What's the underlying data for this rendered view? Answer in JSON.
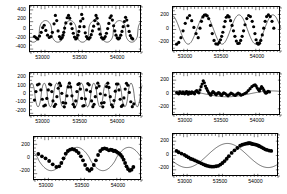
{
  "figure": {
    "width": 287,
    "height": 194,
    "background": "#ffffff",
    "ink": "#000000",
    "layout": "2 columns x 3 rows of time-series panels"
  },
  "chart_data": [
    {
      "type": "scatter",
      "id": "panel-1",
      "position": "top-left",
      "title": "",
      "xlabel": "",
      "ylabel": "",
      "xlim": [
        52820,
        54320
      ],
      "ylim": [
        -500,
        500
      ],
      "xticks": [
        53000,
        53500,
        54000
      ],
      "xticklabels": [
        "53000",
        "53500",
        "54000"
      ],
      "yticks": [
        -400,
        -200,
        0,
        200,
        400
      ],
      "yticklabels": [
        "-400",
        "-200",
        "0",
        "200",
        "400"
      ],
      "grid": false,
      "legend": null,
      "model": {
        "kind": "sine",
        "description": "asymmetric periodic curve with sharp narrow peaks",
        "amplitude": 230,
        "period": 330,
        "phase": 0.62,
        "offset": -40,
        "sharpness": 2.6
      },
      "x": [
        52880,
        52905,
        52925,
        52948,
        52970,
        52990,
        53010,
        53032,
        53055,
        53078,
        53100,
        53120,
        53142,
        53160,
        53178,
        53196,
        53214,
        53232,
        53250,
        53262,
        53272,
        53284,
        53300,
        53318,
        53336,
        53352,
        53368,
        53384,
        53400,
        53416,
        53432,
        53448,
        53462,
        53474,
        53486,
        53498,
        53512,
        53528,
        53544,
        53560,
        53576,
        53592,
        53608,
        53624,
        53640,
        53656,
        53672,
        53688,
        53704,
        53718,
        53730,
        53744,
        53760,
        53778,
        53796,
        53812,
        53828,
        53844,
        53860,
        53876,
        53892,
        53908,
        53924,
        53940,
        53956,
        53972,
        53988,
        54004,
        54020,
        54036,
        54052,
        54068,
        54084,
        54100,
        54116,
        54132,
        54148,
        54164,
        54180,
        54196
      ],
      "y": [
        -150,
        -180,
        -200,
        -140,
        -60,
        40,
        90,
        -20,
        -120,
        -170,
        -150,
        -60,
        120,
        300,
        190,
        -30,
        -150,
        -200,
        -170,
        -120,
        -60,
        30,
        140,
        250,
        300,
        240,
        120,
        20,
        -80,
        -160,
        -200,
        -180,
        -120,
        -40,
        60,
        180,
        320,
        230,
        60,
        -70,
        -150,
        -190,
        -200,
        -170,
        -110,
        -30,
        70,
        190,
        300,
        240,
        120,
        10,
        -100,
        -170,
        -200,
        -190,
        -150,
        -80,
        20,
        130,
        250,
        290,
        200,
        80,
        -30,
        -120,
        -180,
        -200,
        -180,
        -120,
        -40,
        60,
        170,
        260,
        200,
        80,
        -40,
        -130,
        -180,
        -200
      ]
    },
    {
      "type": "scatter",
      "id": "panel-2",
      "position": "top-right",
      "title": "",
      "xlabel": "",
      "ylabel": "",
      "xlim": [
        52820,
        54320
      ],
      "ylim": [
        -330,
        330
      ],
      "xticks": [
        53000,
        53500,
        54000
      ],
      "xticklabels": [
        "53000",
        "53500",
        "54000"
      ],
      "yticks": [
        -200,
        0,
        200
      ],
      "yticklabels": [
        "-200",
        "0",
        "200"
      ],
      "grid": false,
      "legend": null,
      "model": {
        "kind": "sine",
        "description": "smooth sinusoid, about three cycles",
        "amplitude": 215,
        "period": 470,
        "phase": 0.3,
        "offset": 0,
        "sharpness": 1.0
      },
      "x": [
        52870,
        52900,
        52930,
        52960,
        52990,
        53020,
        53050,
        53080,
        53110,
        53140,
        53170,
        53195,
        53215,
        53235,
        53255,
        53275,
        53295,
        53315,
        53340,
        53365,
        53390,
        53415,
        53440,
        53462,
        53480,
        53496,
        53512,
        53528,
        53544,
        53560,
        53580,
        53600,
        53620,
        53640,
        53660,
        53680,
        53700,
        53720,
        53740,
        53760,
        53780,
        53800,
        53820,
        53845,
        53870,
        53895,
        53920,
        53940,
        53958,
        53974,
        53990,
        54006,
        54022,
        54040,
        54060,
        54080,
        54100,
        54120,
        54145,
        54170,
        54195,
        54220
      ],
      "y": [
        -215,
        -190,
        -120,
        -20,
        90,
        170,
        205,
        130,
        30,
        -60,
        -120,
        20,
        120,
        185,
        210,
        215,
        200,
        160,
        60,
        -60,
        -160,
        -210,
        -215,
        -190,
        -150,
        -100,
        -40,
        40,
        120,
        180,
        205,
        185,
        130,
        60,
        -20,
        -100,
        -170,
        -205,
        -200,
        -160,
        -100,
        -20,
        70,
        160,
        205,
        190,
        120,
        40,
        -60,
        -150,
        -200,
        -215,
        -200,
        -160,
        -80,
        20,
        120,
        190,
        215,
        190,
        120,
        20
      ]
    },
    {
      "type": "scatter",
      "id": "panel-3",
      "position": "middle-left",
      "title": "",
      "xlabel": "",
      "ylabel": "",
      "xlim": [
        52820,
        54320
      ],
      "ylim": [
        -260,
        260
      ],
      "xticks": [
        53000,
        53500,
        54000
      ],
      "xticklabels": [
        "53000",
        "53500",
        "54000"
      ],
      "yticks": [
        -200,
        -100,
        0,
        100,
        200
      ],
      "yticklabels": [
        "-200",
        "-100",
        "0",
        "100",
        "200"
      ],
      "grid": false,
      "legend": null,
      "model": {
        "kind": "sine",
        "description": "rapid oscillation, roughly nine cycles",
        "amplitude": 140,
        "period": 166,
        "phase": 0.1,
        "offset": 0,
        "sharpness": 1.35
      },
      "x": [
        52880,
        52900,
        52920,
        52942,
        52965,
        52985,
        53005,
        53025,
        53045,
        53065,
        53082,
        53098,
        53112,
        53128,
        53145,
        53162,
        53180,
        53198,
        53215,
        53230,
        53246,
        53262,
        53280,
        53298,
        53315,
        53332,
        53348,
        53365,
        53382,
        53398,
        53415,
        53432,
        53448,
        53462,
        53478,
        53495,
        53512,
        53528,
        53545,
        53562,
        53578,
        53595,
        53612,
        53628,
        53645,
        53662,
        53678,
        53695,
        53712,
        53728,
        53745,
        53762,
        53778,
        53795,
        53812,
        53828,
        53845,
        53862,
        53878,
        53895,
        53912,
        53928,
        53945,
        53962,
        53978,
        53995,
        54012,
        54028,
        54045,
        54062,
        54078,
        54095,
        54112,
        54130,
        54150,
        54170,
        54190,
        54210
      ],
      "y": [
        -60,
        40,
        120,
        130,
        60,
        -50,
        -130,
        -120,
        -40,
        60,
        130,
        120,
        40,
        -70,
        -135,
        -110,
        -20,
        80,
        140,
        110,
        20,
        -90,
        -140,
        -95,
        -10,
        95,
        140,
        95,
        -10,
        -110,
        -140,
        -70,
        40,
        125,
        135,
        70,
        -40,
        -130,
        -125,
        -45,
        60,
        135,
        120,
        40,
        -70,
        -138,
        -110,
        -20,
        85,
        140,
        105,
        15,
        -95,
        -140,
        -90,
        0,
        100,
        140,
        90,
        -20,
        -115,
        -140,
        -65,
        45,
        130,
        130,
        60,
        -50,
        -135,
        -120,
        -35,
        70,
        138,
        115,
        30,
        -80,
        -138,
        -105
      ]
    },
    {
      "type": "scatter",
      "id": "panel-4",
      "position": "middle-right",
      "title": "",
      "xlabel": "",
      "ylabel": "",
      "xlim": [
        52820,
        54320
      ],
      "ylim": [
        -330,
        330
      ],
      "xticks": [
        53000,
        53500,
        54000
      ],
      "xticklabels": [
        "53000",
        "53500",
        "54000"
      ],
      "yticks": [
        -200,
        0,
        200
      ],
      "yticklabels": [
        "-200",
        "0",
        "200"
      ],
      "grid": false,
      "legend": null,
      "model": {
        "kind": "sine",
        "description": "low amplitude long period trend, nearly flat",
        "amplitude": 45,
        "period": 1250,
        "phase": 0.15,
        "offset": 10,
        "sharpness": 1.0
      },
      "x": [
        52870,
        52885,
        52900,
        52915,
        52930,
        52945,
        52958,
        52970,
        52982,
        52995,
        53008,
        53020,
        53032,
        53045,
        53058,
        53070,
        53082,
        53095,
        53108,
        53120,
        53135,
        53150,
        53165,
        53180,
        53195,
        53210,
        53225,
        53240,
        53255,
        53270,
        53285,
        53300,
        53315,
        53330,
        53345,
        53360,
        53375,
        53390,
        53405,
        53420,
        53435,
        53450,
        53465,
        53480,
        53495,
        53510,
        53525,
        53545,
        53565,
        53585,
        53605,
        53625,
        53645,
        53665,
        53685,
        53705,
        53725,
        53745,
        53765,
        53790,
        53815,
        53840,
        53865,
        53890,
        53915,
        53940,
        53960,
        53975,
        53990,
        54005,
        54020,
        54035,
        54050,
        54065,
        54080,
        54095,
        54110,
        54125,
        54140,
        54160
      ],
      "y": [
        30,
        20,
        10,
        40,
        25,
        15,
        35,
        20,
        10,
        30,
        45,
        20,
        5,
        35,
        25,
        15,
        40,
        30,
        20,
        10,
        50,
        60,
        35,
        25,
        70,
        120,
        160,
        210,
        180,
        130,
        95,
        60,
        30,
        10,
        -10,
        20,
        45,
        30,
        10,
        -5,
        15,
        30,
        20,
        0,
        -15,
        10,
        25,
        15,
        -5,
        -20,
        0,
        20,
        10,
        -5,
        -15,
        5,
        20,
        10,
        -10,
        0,
        15,
        30,
        60,
        90,
        120,
        140,
        150,
        130,
        100,
        75,
        55,
        90,
        120,
        100,
        70,
        40,
        20,
        30,
        50,
        40
      ]
    },
    {
      "type": "scatter",
      "id": "panel-5",
      "position": "bottom-left",
      "title": "",
      "xlabel": "",
      "ylabel": "",
      "xlim": [
        52820,
        54320
      ],
      "ylim": [
        -330,
        330
      ],
      "xticks": [
        53000,
        53500,
        54000
      ],
      "xticklabels": [
        "53000",
        "53500",
        "54000"
      ],
      "yticks": [
        -200,
        0,
        200
      ],
      "yticklabels": [
        "-200",
        "0",
        "200"
      ],
      "grid": false,
      "legend": null,
      "model": {
        "kind": "sine",
        "description": "two slow broad cycles with sparse well separated points",
        "amplitude": 175,
        "period": 720,
        "phase": 0.42,
        "offset": 0,
        "sharpness": 1.2
      },
      "x": [
        52880,
        52930,
        52980,
        53030,
        53080,
        53130,
        53170,
        53200,
        53230,
        53260,
        53290,
        53320,
        53350,
        53380,
        53410,
        53440,
        53470,
        53500,
        53530,
        53560,
        53590,
        53620,
        53650,
        53680,
        53710,
        53740,
        53770,
        53800,
        53830,
        53860,
        53885,
        53905,
        53925,
        53945,
        53965,
        53985,
        54005,
        54025,
        54045,
        54065,
        54085,
        54105,
        54125,
        54150,
        54175,
        54200
      ],
      "y": [
        75,
        40,
        10,
        -30,
        -80,
        -120,
        -110,
        -60,
        10,
        80,
        120,
        140,
        150,
        140,
        120,
        90,
        40,
        -20,
        -90,
        -150,
        -175,
        -150,
        -90,
        -20,
        60,
        120,
        150,
        160,
        150,
        130,
        140,
        135,
        120,
        125,
        110,
        95,
        80,
        60,
        30,
        -10,
        -60,
        -110,
        -150,
        -175,
        -160,
        -120
      ]
    },
    {
      "type": "scatter",
      "id": "panel-6",
      "position": "bottom-right",
      "title": "",
      "xlabel": "",
      "ylabel": "",
      "xlim": [
        52820,
        54320
      ],
      "ylim": [
        -330,
        330
      ],
      "xticks": [
        53000,
        53500,
        54000
      ],
      "xticklabels": [
        "53000",
        "53500",
        "54000"
      ],
      "yticks": [
        -200,
        0,
        200
      ],
      "yticklabels": [
        "-200",
        "0",
        "200"
      ],
      "grid": false,
      "legend": null,
      "model": {
        "kind": "sine",
        "description": "single slow cycle, minimum near 53500 and maximum near 53950",
        "amplitude": 185,
        "period": 1150,
        "phase": 0.58,
        "offset": 0,
        "sharpness": 1.0
      },
      "x": [
        52870,
        52900,
        52940,
        52980,
        53010,
        53040,
        53070,
        53100,
        53130,
        53160,
        53190,
        53220,
        53250,
        53280,
        53310,
        53340,
        53370,
        53400,
        53430,
        53460,
        53490,
        53520,
        53550,
        53580,
        53610,
        53650,
        53690,
        53730,
        53770,
        53800,
        53830,
        53855,
        53875,
        53890,
        53905,
        53920,
        53935,
        53950,
        53970,
        53990,
        54010,
        54030,
        54050,
        54075,
        54100,
        54125,
        54150,
        54180,
        54210
      ],
      "y": [
        70,
        50,
        30,
        10,
        -10,
        -30,
        -50,
        -60,
        -75,
        -90,
        -105,
        -120,
        -135,
        -150,
        -160,
        -168,
        -172,
        -170,
        -165,
        -158,
        -140,
        -115,
        -85,
        -50,
        -10,
        40,
        80,
        115,
        150,
        165,
        175,
        182,
        185,
        188,
        190,
        185,
        180,
        175,
        172,
        168,
        160,
        150,
        140,
        125,
        110,
        95,
        85,
        75,
        70
      ]
    }
  ]
}
